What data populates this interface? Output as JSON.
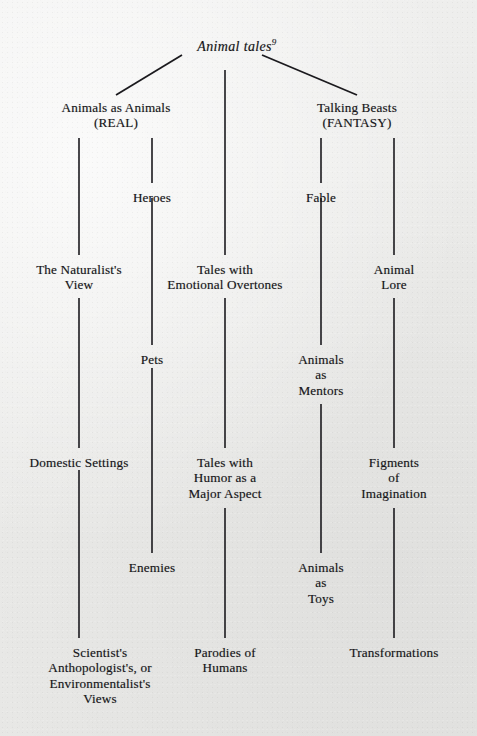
{
  "diagram": {
    "title": "Animal tales",
    "title_superscript": "9",
    "type": "tree-taxonomy",
    "background_color": "#ececeb",
    "line_color": "#1b1a1e",
    "text_color": "#17161a",
    "columns": [
      79,
      152,
      225,
      321,
      394
    ],
    "nodes": [
      {
        "id": "root",
        "label": "Animal tales",
        "superscript": "9",
        "x": 237,
        "y": 37,
        "lines": [
          "Animal tales"
        ]
      },
      {
        "id": "real",
        "label": "Animals as Animals (REAL)",
        "x": 116,
        "y": 100,
        "lines": [
          "Animals as Animals",
          "(REAL)"
        ]
      },
      {
        "id": "fantasy",
        "label": "Talking Beasts (FANTASY)",
        "x": 357,
        "y": 100,
        "lines": [
          "Talking Beasts",
          "(FANTASY)"
        ]
      },
      {
        "id": "heroes",
        "label": "Heroes",
        "x": 152,
        "y": 190,
        "lines": [
          "Heroes"
        ]
      },
      {
        "id": "fable",
        "label": "Fable",
        "x": 321,
        "y": 190,
        "lines": [
          "Fable"
        ]
      },
      {
        "id": "naturalist",
        "label": "The Naturalist's View",
        "x": 79,
        "y": 262,
        "lines": [
          "The Naturalist's",
          "View"
        ]
      },
      {
        "id": "emotional",
        "label": "Tales with Emotional Overtones",
        "x": 225,
        "y": 262,
        "lines": [
          "Tales with",
          "Emotional Overtones"
        ]
      },
      {
        "id": "lore",
        "label": "Animal Lore",
        "x": 394,
        "y": 262,
        "lines": [
          "Animal",
          "Lore"
        ]
      },
      {
        "id": "pets",
        "label": "Pets",
        "x": 152,
        "y": 352,
        "lines": [
          "Pets"
        ]
      },
      {
        "id": "mentors",
        "label": "Animals as Mentors",
        "x": 321,
        "y": 352,
        "lines": [
          "Animals",
          "as",
          "Mentors"
        ]
      },
      {
        "id": "domestic",
        "label": "Domestic Settings",
        "x": 79,
        "y": 455,
        "lines": [
          "Domestic Settings"
        ]
      },
      {
        "id": "humor",
        "label": "Tales with Humor as a Major Aspect",
        "x": 225,
        "y": 455,
        "lines": [
          "Tales with",
          "Humor as a",
          "Major Aspect"
        ]
      },
      {
        "id": "figments",
        "label": "Figments of Imagination",
        "x": 394,
        "y": 455,
        "lines": [
          "Figments",
          "of",
          "Imagination"
        ]
      },
      {
        "id": "enemies",
        "label": "Enemies",
        "x": 152,
        "y": 560,
        "lines": [
          "Enemies"
        ]
      },
      {
        "id": "toys",
        "label": "Animals as Toys",
        "x": 321,
        "y": 560,
        "lines": [
          "Animals",
          "as",
          "Toys"
        ]
      },
      {
        "id": "views",
        "label": "Scientist's Anthopologist's, or Environmentalist's Views",
        "x": 100,
        "y": 645,
        "lines": [
          "Scientist's",
          "Anthopologist's, or",
          "Environmentalist's",
          "Views"
        ]
      },
      {
        "id": "parodies",
        "label": "Parodies of Humans",
        "x": 225,
        "y": 645,
        "lines": [
          "Parodies of",
          "Humans"
        ]
      },
      {
        "id": "transform",
        "label": "Transformations",
        "x": 394,
        "y": 645,
        "lines": [
          "Transformations"
        ]
      }
    ],
    "edges": [
      {
        "from": "root",
        "to": "real",
        "kind": "diagonal",
        "x1": 182,
        "y1": 55,
        "x2": 116,
        "y2": 95
      },
      {
        "from": "root",
        "to": "fantasy",
        "kind": "diagonal",
        "x1": 262,
        "y1": 55,
        "x2": 357,
        "y2": 95
      },
      {
        "from": "root",
        "to": "emotional",
        "kind": "vertical",
        "x1": 225,
        "y1": 70,
        "x2": 225,
        "y2": 255
      },
      {
        "from": "real",
        "to": "naturalist",
        "kind": "vertical",
        "x1": 79,
        "y1": 138,
        "x2": 79,
        "y2": 255
      },
      {
        "from": "real",
        "to": "heroes",
        "kind": "vertical",
        "x1": 152,
        "y1": 138,
        "x2": 152,
        "y2": 183
      },
      {
        "from": "heroes",
        "to": "pets",
        "kind": "vertical",
        "x1": 152,
        "y1": 198,
        "x2": 152,
        "y2": 345
      },
      {
        "from": "fantasy",
        "to": "fable",
        "kind": "vertical",
        "x1": 321,
        "y1": 138,
        "x2": 321,
        "y2": 183
      },
      {
        "from": "fable",
        "to": "mentors",
        "kind": "vertical",
        "x1": 321,
        "y1": 198,
        "x2": 321,
        "y2": 345
      },
      {
        "from": "fantasy",
        "to": "lore",
        "kind": "vertical",
        "x1": 394,
        "y1": 138,
        "x2": 394,
        "y2": 255
      },
      {
        "from": "naturalist",
        "to": "domestic",
        "kind": "vertical",
        "x1": 79,
        "y1": 298,
        "x2": 79,
        "y2": 448
      },
      {
        "from": "emotional",
        "to": "humor",
        "kind": "vertical",
        "x1": 225,
        "y1": 298,
        "x2": 225,
        "y2": 448
      },
      {
        "from": "lore",
        "to": "figments",
        "kind": "vertical",
        "x1": 394,
        "y1": 298,
        "x2": 394,
        "y2": 448
      },
      {
        "from": "pets",
        "to": "enemies",
        "kind": "vertical",
        "x1": 152,
        "y1": 368,
        "x2": 152,
        "y2": 553
      },
      {
        "from": "mentors",
        "to": "toys",
        "kind": "vertical",
        "x1": 321,
        "y1": 404,
        "x2": 321,
        "y2": 553
      },
      {
        "from": "domestic",
        "to": "views",
        "kind": "vertical",
        "x1": 79,
        "y1": 470,
        "x2": 79,
        "y2": 638
      },
      {
        "from": "humor",
        "to": "parodies",
        "kind": "vertical",
        "x1": 225,
        "y1": 508,
        "x2": 225,
        "y2": 638
      },
      {
        "from": "figments",
        "to": "transform",
        "kind": "vertical",
        "x1": 394,
        "y1": 508,
        "x2": 394,
        "y2": 638
      }
    ]
  }
}
